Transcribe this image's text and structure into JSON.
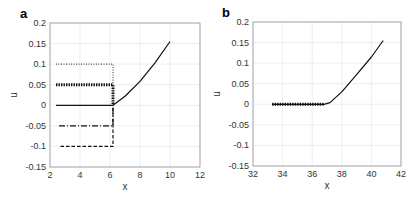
{
  "chart_data": [
    {
      "panel": "a",
      "type": "line",
      "xlabel": "x",
      "ylabel": "u",
      "xlim": [
        2,
        12
      ],
      "ylim": [
        -0.15,
        0.2
      ],
      "xticks": [
        2,
        4,
        6,
        8,
        10,
        12
      ],
      "xtick_labels": [
        "2",
        "4",
        "6",
        "8",
        "10",
        "12"
      ],
      "yticks": [
        -0.15,
        -0.1,
        -0.05,
        0,
        0.05,
        0.1,
        0.15,
        0.2
      ],
      "ytick_labels": [
        "-0.15",
        "-0.1",
        "-0.05",
        "0",
        "0.05",
        "0.1",
        "0.15",
        "0.2"
      ],
      "grid": true,
      "series": [
        {
          "name": "u=0.1 initial",
          "style": "dotted",
          "x": [
            2.4,
            6.2,
            6.2
          ],
          "y": [
            0.1,
            0.1,
            0.0
          ]
        },
        {
          "name": "u=0.05 initial",
          "style": "thick-dotted",
          "x": [
            2.4,
            6.2,
            6.2
          ],
          "y": [
            0.05,
            0.05,
            0.0
          ]
        },
        {
          "name": "u=0 initial",
          "style": "solid",
          "x": [
            2.4,
            6.2
          ],
          "y": [
            0.0,
            0.0
          ]
        },
        {
          "name": "u=-0.05 initial",
          "style": "dash-dot",
          "x": [
            2.6,
            6.2,
            6.2
          ],
          "y": [
            -0.05,
            -0.05,
            0.0
          ]
        },
        {
          "name": "u=-0.1 initial",
          "style": "dashed",
          "x": [
            2.7,
            6.2,
            6.2
          ],
          "y": [
            -0.1,
            -0.1,
            0.0
          ]
        },
        {
          "name": "converged",
          "style": "solid",
          "x": [
            6.2,
            7.0,
            8.0,
            9.0,
            10.0
          ],
          "y": [
            0.0,
            0.022,
            0.058,
            0.103,
            0.155
          ]
        }
      ]
    },
    {
      "panel": "b",
      "type": "line",
      "xlabel": "x",
      "ylabel": "u",
      "xlim": [
        32,
        42
      ],
      "ylim": [
        -0.15,
        0.2
      ],
      "xticks": [
        32,
        34,
        36,
        38,
        40,
        42
      ],
      "xtick_labels": [
        "32",
        "34",
        "36",
        "38",
        "40",
        "42"
      ],
      "yticks": [
        -0.15,
        -0.1,
        -0.05,
        0,
        0.05,
        0.1,
        0.15,
        0.2
      ],
      "ytick_labels": [
        "-0.15",
        "-0.1",
        "-0.05",
        "0",
        "0.05",
        "0.1",
        "0.15",
        "0.2"
      ],
      "grid": true,
      "series": [
        {
          "name": "markers",
          "style": "thick-dotted",
          "x": [
            33.3,
            36.8
          ],
          "y": [
            0.0,
            0.0
          ]
        },
        {
          "name": "solution",
          "style": "solid",
          "x": [
            33.3,
            36.8,
            37.2,
            38.0,
            39.0,
            40.0,
            40.8
          ],
          "y": [
            0.0,
            0.0,
            0.004,
            0.03,
            0.072,
            0.115,
            0.155
          ]
        }
      ]
    }
  ],
  "panels": {
    "a": {
      "label": "a",
      "xlabel": "x",
      "ylabel": "u"
    },
    "b": {
      "label": "b",
      "xlabel": "x",
      "ylabel": "u"
    }
  }
}
